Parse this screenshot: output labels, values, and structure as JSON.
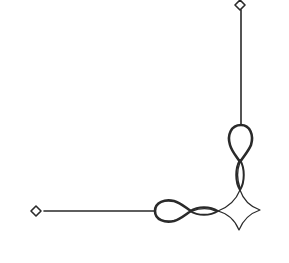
{
  "ornament": {
    "title": "Decorative corner ornament",
    "stroke_color": "#2a2a2a",
    "background_color": "#ffffff",
    "elements": [
      {
        "name": "top-end-diamond",
        "cx": 240,
        "cy": 5
      },
      {
        "name": "left-end-diamond",
        "cx": 36,
        "cy": 211
      },
      {
        "name": "corner-diamond",
        "cx": 239,
        "cy": 210
      }
    ]
  }
}
